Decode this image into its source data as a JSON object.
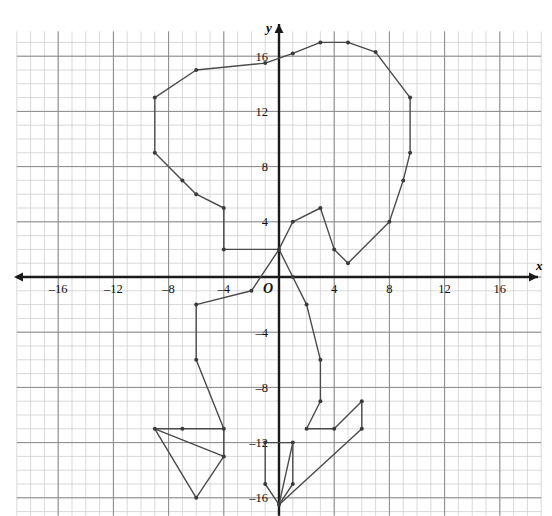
{
  "figure": {
    "kind": "coordinate-plane-polyline-drawing",
    "background": "#ffffff"
  },
  "chart_data": {
    "type": "scatter",
    "title": "",
    "xlabel": "x",
    "ylabel": "y",
    "origin_label": "O",
    "grid": true,
    "minor_grid_step": 1,
    "major_grid_step": 4,
    "xlim": [
      -19,
      19
    ],
    "ylim": [
      -17.3,
      17.8
    ],
    "xticks": [
      -16,
      -12,
      -8,
      -4,
      4,
      8,
      12,
      16
    ],
    "yticks": [
      16,
      12,
      8,
      4,
      -4,
      -8,
      -12,
      -16
    ],
    "xtick_labels": [
      "–16",
      "–12",
      "–8",
      "–4",
      "4",
      "8",
      "12",
      "16"
    ],
    "ytick_labels": [
      "16",
      "12",
      "8",
      "4",
      "–4",
      "–8",
      "–12",
      "–16"
    ],
    "legend": null,
    "series": [
      {
        "name": "outline-head-and-body",
        "closed": false,
        "points": [
          [
            0,
            2
          ],
          [
            -4,
            2
          ],
          [
            -4,
            5
          ],
          [
            -6,
            6
          ],
          [
            -7,
            7
          ],
          [
            -9,
            9
          ],
          [
            -9,
            13
          ],
          [
            -6,
            15
          ],
          [
            -1,
            15.5
          ],
          [
            1,
            16.2
          ],
          [
            3,
            17
          ],
          [
            5,
            17
          ],
          [
            7,
            16.3
          ],
          [
            9.5,
            13
          ],
          [
            9.5,
            9
          ],
          [
            9,
            7
          ],
          [
            8,
            4
          ],
          [
            5,
            1
          ],
          [
            4,
            2
          ],
          [
            3,
            5
          ],
          [
            1,
            4
          ],
          [
            0,
            2
          ]
        ]
      },
      {
        "name": "left-leg",
        "closed": false,
        "points": [
          [
            0,
            2
          ],
          [
            -2,
            -1
          ],
          [
            -6,
            -2
          ],
          [
            -6,
            -6
          ],
          [
            -4,
            -11
          ],
          [
            -4,
            -13
          ]
        ]
      },
      {
        "name": "left-foot",
        "closed": false,
        "points": [
          [
            -4,
            -13
          ],
          [
            -6,
            -16
          ],
          [
            -9,
            -11
          ],
          [
            -7,
            -11
          ],
          [
            -4,
            -11
          ]
        ]
      },
      {
        "name": "left-foot-inner",
        "closed": false,
        "points": [
          [
            -9,
            -11
          ],
          [
            -4,
            -13
          ]
        ]
      },
      {
        "name": "right-leg",
        "closed": false,
        "points": [
          [
            0,
            2
          ],
          [
            1,
            0
          ],
          [
            2,
            -2
          ],
          [
            3,
            -6
          ],
          [
            3,
            -9
          ],
          [
            2,
            -11
          ],
          [
            4,
            -11
          ],
          [
            6,
            -9
          ],
          [
            6,
            -11
          ]
        ]
      },
      {
        "name": "right-foot",
        "closed": false,
        "points": [
          [
            6,
            -11
          ],
          [
            0,
            -16.5
          ]
        ]
      },
      {
        "name": "center-foot",
        "closed": false,
        "points": [
          [
            -1,
            -12
          ],
          [
            1,
            -12
          ],
          [
            1,
            -15
          ],
          [
            0,
            -16.5
          ],
          [
            -1,
            -15
          ],
          [
            -1,
            -12
          ]
        ]
      },
      {
        "name": "center-foot-stem",
        "closed": false,
        "points": [
          [
            1,
            -12
          ],
          [
            0,
            -16.5
          ]
        ]
      }
    ],
    "marker": {
      "shape": "circle",
      "size_px": 4,
      "color": "#3a3a3a"
    },
    "line": {
      "color": "#4a4a4a",
      "width_px": 1.4
    },
    "colors": {
      "axis": "#1a1a1a",
      "major_grid": "#8a8a8a",
      "minor_grid": "#c9c9c9",
      "text": "#111111"
    }
  }
}
